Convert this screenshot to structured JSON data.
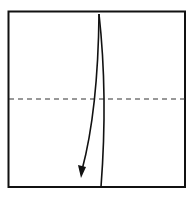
{
  "diagram": {
    "type": "origami-fold-step",
    "square": {
      "x1": 8,
      "y1": 11,
      "x2": 185,
      "y2": 187
    },
    "fold_line": {
      "style": "dashed",
      "kind": "valley-fold",
      "y": 99
    },
    "arrow": {
      "from": [
        99,
        14
      ],
      "to": [
        81,
        178
      ],
      "direction": "down"
    },
    "colors": {
      "stroke": "#111111",
      "paper": "#ffffff"
    }
  }
}
